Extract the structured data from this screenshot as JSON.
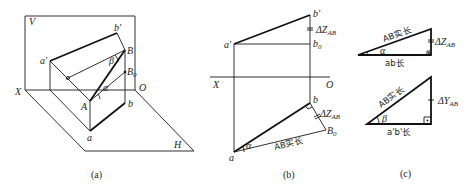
{
  "panels": {
    "a": {
      "caption": "(a)",
      "labels": {
        "V": "V",
        "X": "X",
        "O": "O",
        "H": "H",
        "a_prime": "a'",
        "b_prime": "b'",
        "B": "B",
        "A": "A",
        "a": "a",
        "b": "b",
        "B0": "B",
        "B0_sub": "0",
        "alpha": "α",
        "beta": "β"
      }
    },
    "b": {
      "caption": "(b)",
      "labels": {
        "b_prime": "b'",
        "a_prime": "a'",
        "b0_prime": "b",
        "b0_prime_sub": "0",
        "b0_prime_sup": "'",
        "dz_top": "ΔZ",
        "dz_top_sub": "AB",
        "X": "X",
        "O": "O",
        "b": "b",
        "dz_bottom": "ΔZ",
        "dz_bottom_sub": "AB",
        "B0": "B",
        "B0_sub": "0",
        "a": "a",
        "alpha": "α",
        "true_length": "AB实长"
      }
    },
    "c": {
      "caption": "(c)",
      "top_triangle": {
        "hypotenuse": "AB实长",
        "vertical": "ΔZ",
        "vertical_sub": "AB",
        "base": "ab长",
        "angle": "α"
      },
      "bottom_triangle": {
        "hypotenuse": "AB实长",
        "vertical": "ΔY",
        "vertical_sub": "AB",
        "base": "a'b'长",
        "angle": "β"
      }
    }
  }
}
